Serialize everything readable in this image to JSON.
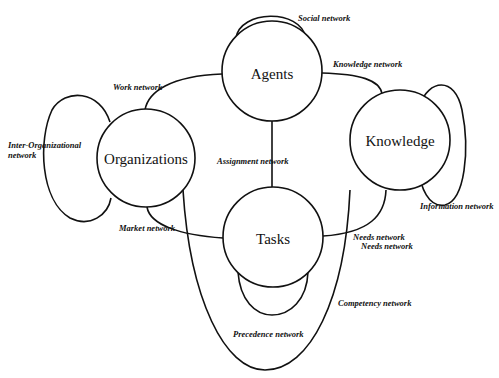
{
  "diagram": {
    "nodes": {
      "agents": "Agents",
      "organizations": "Organizations",
      "knowledge": "Knowledge",
      "tasks": "Tasks"
    },
    "edges": {
      "social": "Social network",
      "knowledge_net": "Knowledge network",
      "work": "Work network",
      "inter_org_line1": "Inter-Organizational",
      "inter_org_line2": "network",
      "assignment": "Assignment network",
      "information": "Information network",
      "market": "Market network",
      "needs1": "Needs network",
      "needs2": "Needs network",
      "competency": "Competency network",
      "precedence": "Precedence network"
    }
  }
}
